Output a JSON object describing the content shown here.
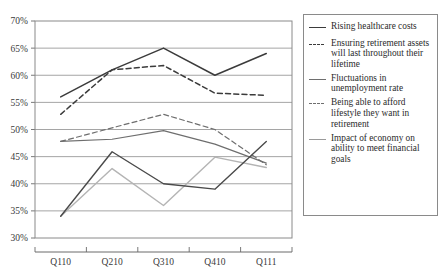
{
  "chart_data": {
    "type": "line",
    "title": "",
    "xlabel": "",
    "ylabel": "",
    "categories": [
      "Q110",
      "Q210",
      "Q310",
      "Q410",
      "Q111"
    ],
    "ylim": [
      30,
      70
    ],
    "ytick_step": 5,
    "ytick_labels": [
      "70%",
      "65%",
      "60%",
      "55%",
      "50%",
      "45%",
      "40%",
      "35%",
      "30%"
    ],
    "ytick_values": [
      70,
      65,
      60,
      55,
      50,
      45,
      40,
      35,
      30
    ],
    "grid": "horizontal",
    "legend_position": "right",
    "value_suffix": "%",
    "series": [
      {
        "name": "Rising healthcare costs",
        "values": [
          56,
          61,
          65,
          60,
          64
        ],
        "style": "solid",
        "color": "#3b3b3b",
        "width": 1.5
      },
      {
        "name": "Ensuring retirement assets will last throughout their lifetime",
        "values": [
          52.8,
          61,
          61.8,
          56.7,
          56.3
        ],
        "style": "dashed",
        "color": "#3b3b3b",
        "width": 1.5
      },
      {
        "name": "Fluctuations in unemployment rate",
        "values": [
          47.8,
          48.2,
          49.8,
          47.3,
          43.8
        ],
        "style": "solid",
        "color": "#6e6e6e",
        "width": 1.2
      },
      {
        "name": "Being able to afford lifestyle they want in retirement",
        "values": [
          47.8,
          50.3,
          52.8,
          50.0,
          43.5
        ],
        "style": "dashed",
        "color": "#6e6e6e",
        "width": 1.2
      },
      {
        "name": "Impact of economy on ability to meet financial goals",
        "values": [
          34.0,
          42.8,
          36.0,
          44.9,
          43.0
        ],
        "style": "solid",
        "color": "#b4b4b4",
        "width": 1.4
      },
      {
        "name": "Rising healthcare costs (secondary)",
        "values": [
          34.0,
          45.9,
          40.0,
          39.0,
          47.8
        ],
        "style": "solid",
        "color": "#4a4a4a",
        "width": 1.4,
        "in_legend": false
      }
    ]
  },
  "legend": {
    "entries": [
      {
        "label": "Rising healthcare costs",
        "style": "solid",
        "color": "#3b3b3b"
      },
      {
        "label": "Ensuring retirement assets will last throughout their lifetime",
        "style": "dashed",
        "color": "#3b3b3b"
      },
      {
        "label": "Fluctuations in unemployment rate",
        "style": "solid",
        "color": "#6e6e6e"
      },
      {
        "label": "Being able to afford lifestyle they want in retirement",
        "style": "dashed",
        "color": "#6e6e6e"
      },
      {
        "label": "Impact of economy on ability to meet financial goals",
        "style": "solid",
        "color": "#9a9a9a"
      }
    ]
  },
  "colors": {
    "axis": "#6a6a6a",
    "grid": "#9b9b9b",
    "frame": "#8a8a8a",
    "text": "#2b2b2b",
    "background": "#ffffff"
  }
}
